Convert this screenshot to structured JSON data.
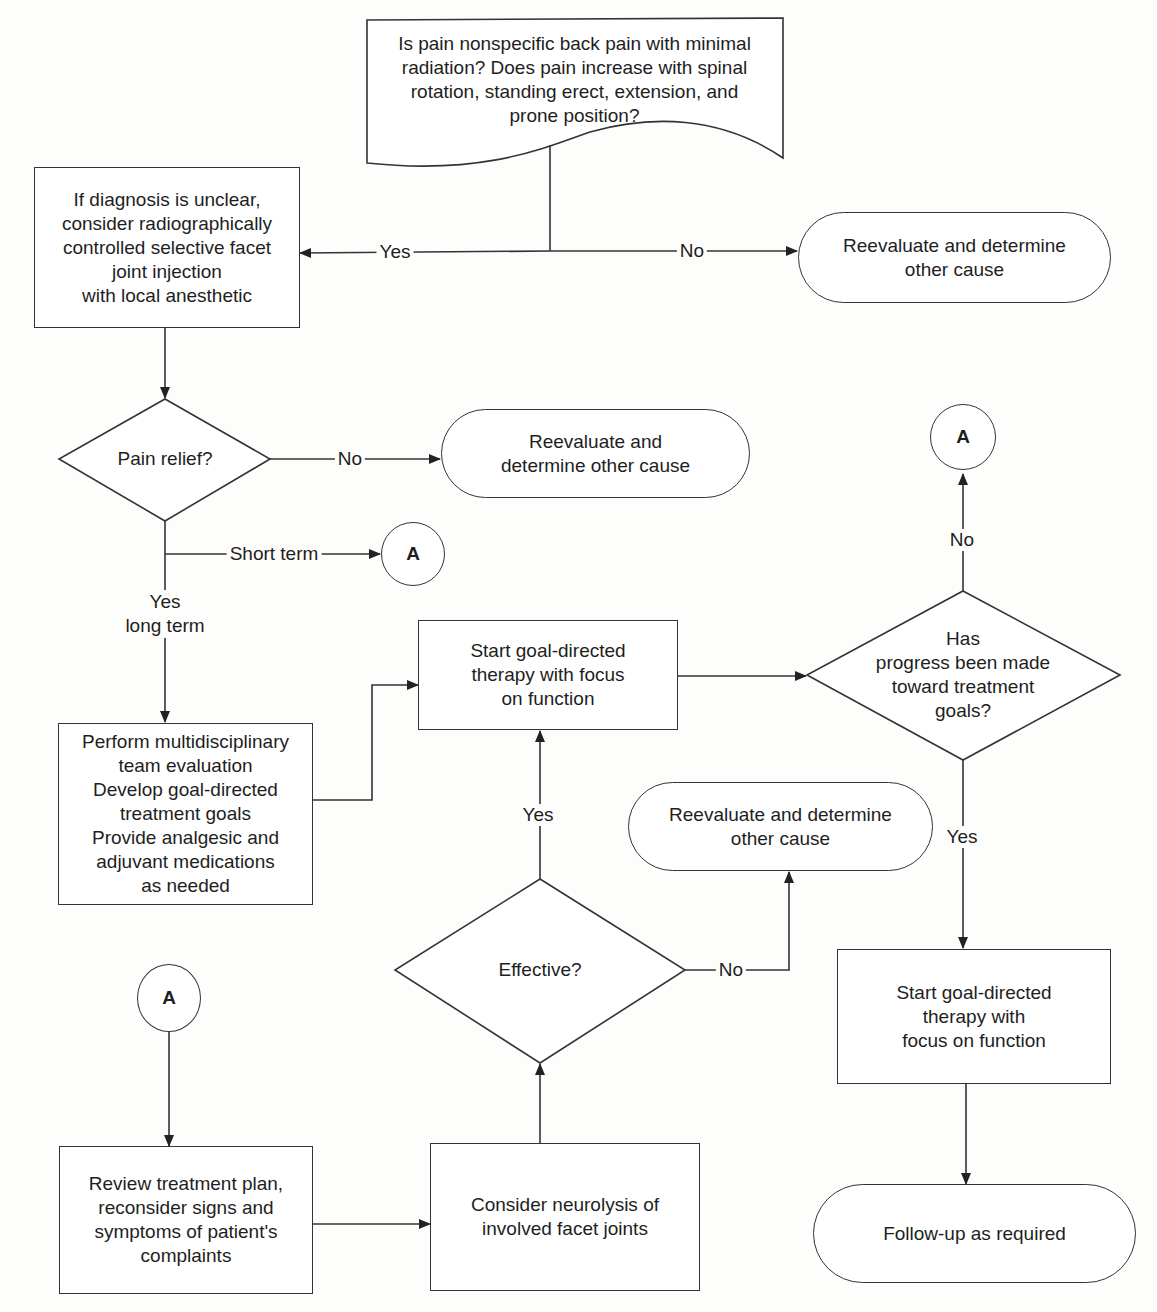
{
  "diagram": {
    "type": "flowchart",
    "start": {
      "lines": [
        "Is pain nonspecific back pain with minimal",
        "radiation? Does pain increase with spinal",
        "rotation, standing erect, extension, and",
        "prone position?"
      ]
    },
    "injection_box": {
      "lines": [
        "If diagnosis is unclear,",
        "consider radiographically",
        "controlled selective facet",
        "joint injection",
        "with local anesthetic"
      ]
    },
    "reeval_top": {
      "lines": [
        "Reevaluate and determine",
        "other cause"
      ]
    },
    "pain_relief": {
      "label": "Pain relief?"
    },
    "reeval_mid": {
      "lines": [
        "Reevaluate and",
        "determine other cause"
      ]
    },
    "connector_a_short": {
      "label": "A"
    },
    "connector_a_top": {
      "label": "A"
    },
    "connector_a_bottom": {
      "label": "A"
    },
    "multidisciplinary_box": {
      "lines": [
        "Perform multidisciplinary",
        "team evaluation",
        "Develop goal-directed",
        "treatment goals",
        "Provide analgesic and",
        "adjuvant medications",
        "as needed"
      ]
    },
    "goal_therapy_center": {
      "lines": [
        "Start goal-directed",
        "therapy with focus",
        "on function"
      ]
    },
    "progress_decision": {
      "lines": [
        "Has",
        "progress been made",
        "toward treatment",
        "goals?"
      ]
    },
    "reeval_lower": {
      "lines": [
        "Reevaluate and determine",
        "other cause"
      ]
    },
    "effective_decision": {
      "label": "Effective?"
    },
    "goal_therapy_right": {
      "lines": [
        "Start goal-directed",
        "therapy with",
        "focus on function"
      ]
    },
    "review_box": {
      "lines": [
        "Review treatment plan,",
        "reconsider signs and",
        "symptoms of patient's",
        "complaints"
      ]
    },
    "neurolysis_box": {
      "lines": [
        "Consider neurolysis of",
        "involved facet joints"
      ]
    },
    "followup": {
      "label": "Follow-up as required"
    },
    "edge_labels": {
      "start_yes": "Yes",
      "start_no": "No",
      "pain_no": "No",
      "short_term": "Short term",
      "yes_long_term": [
        "Yes",
        "long term"
      ],
      "progress_no": "No",
      "progress_yes": "Yes",
      "effective_yes": "Yes",
      "effective_no": "No"
    },
    "colors": {
      "stroke": "#333333",
      "background": "#fdfdfc",
      "text": "#1e1e1e"
    }
  }
}
